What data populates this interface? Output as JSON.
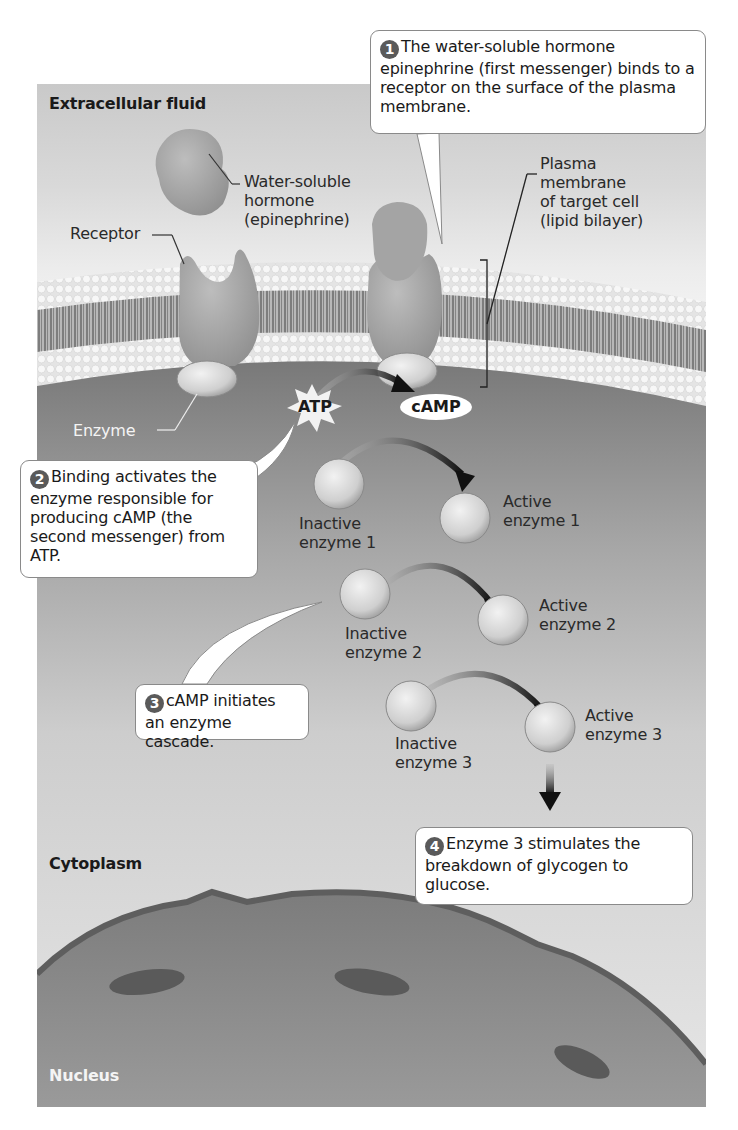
{
  "figure": {
    "colors": {
      "extracellular_bg": "#d4d4d4",
      "cytoplasm_dark": "#7b7b7b",
      "cytoplasm_light": "#d2d2d2",
      "membrane_heads": "#ececec",
      "protein": "#a8a8a8",
      "enzyme_ball": "#d8d8d8",
      "nucleus": "#8a8a8a",
      "callout_border": "#8a8a8a",
      "step_number_bg": "#5a5a5a"
    }
  },
  "regions": {
    "extracellular": "Extracellular fluid",
    "cytoplasm": "Cytoplasm",
    "nucleus": "Nucleus"
  },
  "labels": {
    "hormone": "Water-soluble\nhormone\n(epinephrine)",
    "receptor": "Receptor",
    "enzyme": "Enzyme",
    "membrane": "Plasma\nmembrane\nof target cell\n(lipid bilayer)",
    "atp": "ATP",
    "camp": "cAMP",
    "inactive_enzyme_1": "Inactive\nenzyme 1",
    "active_enzyme_1": "Active\nenzyme 1",
    "inactive_enzyme_2": "Inactive\nenzyme 2",
    "active_enzyme_2": "Active\nenzyme 2",
    "inactive_enzyme_3": "Inactive\nenzyme 3",
    "active_enzyme_3": "Active\nenzyme 3"
  },
  "steps": [
    {
      "number": "1",
      "text": "The water-soluble hormone epinephrine (first messenger) binds to a receptor on the surface of the plasma membrane."
    },
    {
      "number": "2",
      "text": "Binding activates the enzyme responsible for producing cAMP (the second messenger) from ATP."
    },
    {
      "number": "3",
      "text": "cAMP initiates an enzyme cascade."
    },
    {
      "number": "4",
      "text": "Enzyme 3 stimulates the breakdown of glycogen to glucose."
    }
  ]
}
